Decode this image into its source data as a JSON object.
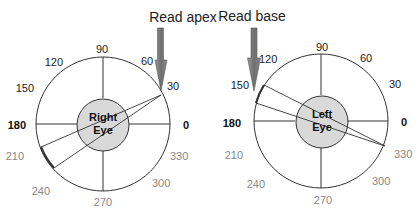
{
  "diagrams": [
    {
      "eye_label_line1": "Right",
      "eye_label_line2": "Eye",
      "arrow_label": "Read apex",
      "center": [
        103,
        124
      ],
      "outer_radius": 67,
      "inner_radius": 26,
      "labels": {
        "a0": "0",
        "a30": "30",
        "a60": "60",
        "a90": "90",
        "a120": "120",
        "a150": "150",
        "a180": "180",
        "a210": "210",
        "a240": "240",
        "a270": "270",
        "a300": "300",
        "a330": "330"
      }
    },
    {
      "eye_label_line1": "Left",
      "eye_label_line2": "Eye",
      "arrow_label": "Read base",
      "center": [
        322,
        122
      ],
      "outer_radius": 67,
      "inner_radius": 26,
      "labels": {
        "a0": "0",
        "a30": "30",
        "a60": "60",
        "a90": "90",
        "a120": "120",
        "a150": "150",
        "a180": "180",
        "a210": "210",
        "a240": "240",
        "a270": "270",
        "a300": "300",
        "a330": "330"
      }
    }
  ],
  "colors": {
    "inner_fill": "#d9d9d9",
    "arrow_fill": "#7a7a7a",
    "line": "#333333"
  }
}
